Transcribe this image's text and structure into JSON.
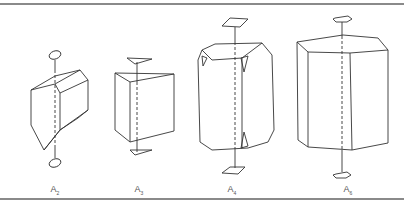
{
  "figure": {
    "panels": [
      {
        "id": "A2",
        "label": "A",
        "subscript": "2",
        "axis_symbol": "ellipse"
      },
      {
        "id": "A3",
        "label": "A",
        "subscript": "3",
        "axis_symbol": "triangle"
      },
      {
        "id": "A4",
        "label": "A",
        "subscript": "4",
        "axis_symbol": "square"
      },
      {
        "id": "A6",
        "label": "A",
        "subscript": "6",
        "axis_symbol": "hexagon"
      }
    ]
  },
  "colors": {
    "line": "#333333",
    "rule": "#8a8a8a",
    "label": "#555555"
  }
}
